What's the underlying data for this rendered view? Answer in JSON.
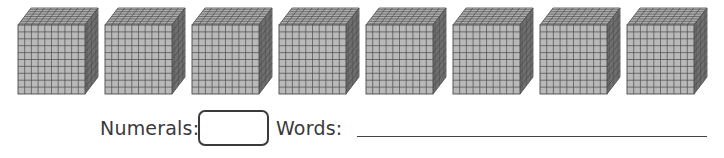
{
  "figure": {
    "cube_count": 8,
    "cube_grid_divisions": 10,
    "colors": {
      "cube_face": "#b9b9b9",
      "cube_top": "#c8c8c8",
      "cube_side": "#8e8e8e",
      "grid_line": "#4a4a4a",
      "text": "#3a3a3a"
    }
  },
  "answer_row": {
    "numerals_label": "Numerals:",
    "numerals_value": "",
    "words_label": "Words:",
    "words_value": ""
  }
}
